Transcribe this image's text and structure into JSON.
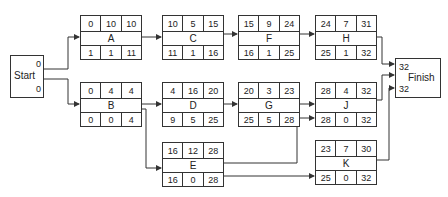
{
  "diagram": {
    "type": "activity-on-node network (critical path method)",
    "cell_layout": {
      "top_row": [
        "ES",
        "Duration",
        "EF"
      ],
      "bottom_row": [
        "LS",
        "Slack",
        "LF"
      ]
    },
    "start": {
      "label": "Start",
      "values": [
        "0",
        "0"
      ]
    },
    "finish": {
      "label": "Finish",
      "values": [
        "32",
        "32"
      ]
    },
    "nodes": {
      "A": {
        "label": "A",
        "top": [
          "0",
          "10",
          "10"
        ],
        "bottom": [
          "1",
          "1",
          "11"
        ]
      },
      "B": {
        "label": "B",
        "top": [
          "0",
          "4",
          "4"
        ],
        "bottom": [
          "0",
          "0",
          "4"
        ]
      },
      "C": {
        "label": "C",
        "top": [
          "10",
          "5",
          "15"
        ],
        "bottom": [
          "11",
          "1",
          "16"
        ]
      },
      "D": {
        "label": "D",
        "top": [
          "4",
          "16",
          "20"
        ],
        "bottom": [
          "9",
          "5",
          "25"
        ]
      },
      "E": {
        "label": "E",
        "top": [
          "16",
          "12",
          "28"
        ],
        "bottom": [
          "16",
          "0",
          "28"
        ]
      },
      "F": {
        "label": "F",
        "top": [
          "15",
          "9",
          "24"
        ],
        "bottom": [
          "16",
          "1",
          "25"
        ]
      },
      "G": {
        "label": "G",
        "top": [
          "20",
          "3",
          "23"
        ],
        "bottom": [
          "25",
          "5",
          "28"
        ]
      },
      "H": {
        "label": "H",
        "top": [
          "24",
          "7",
          "31"
        ],
        "bottom": [
          "25",
          "1",
          "32"
        ]
      },
      "J": {
        "label": "J",
        "top": [
          "28",
          "4",
          "32"
        ],
        "bottom": [
          "28",
          "0",
          "32"
        ]
      },
      "K": {
        "label": "K",
        "top": [
          "23",
          "7",
          "30"
        ],
        "bottom": [
          "25",
          "0",
          "32"
        ]
      }
    },
    "edges": [
      [
        "Start",
        "A"
      ],
      [
        "Start",
        "B"
      ],
      [
        "A",
        "C"
      ],
      [
        "C",
        "F"
      ],
      [
        "F",
        "H"
      ],
      [
        "H",
        "Finish"
      ],
      [
        "B",
        "D"
      ],
      [
        "D",
        "G"
      ],
      [
        "G",
        "J"
      ],
      [
        "J",
        "Finish"
      ],
      [
        "B",
        "E"
      ],
      [
        "E",
        "J"
      ],
      [
        "E",
        "K"
      ],
      [
        "K",
        "Finish"
      ]
    ]
  }
}
